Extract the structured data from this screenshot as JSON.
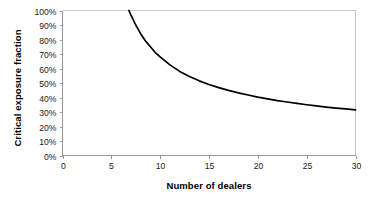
{
  "chart_data": {
    "type": "line",
    "title": "",
    "xlabel": "Number of dealers",
    "ylabel": "Critical exposure fraction",
    "xlim": [
      0,
      30
    ],
    "ylim": [
      0,
      1.0
    ],
    "grid": false,
    "legend": null,
    "xticks": [
      "0",
      "5",
      "10",
      "15",
      "20",
      "25",
      "30"
    ],
    "xtick_values": [
      0,
      5,
      10,
      15,
      20,
      25,
      30
    ],
    "yticks": [
      "0%",
      "10%",
      "20%",
      "30%",
      "40%",
      "50%",
      "60%",
      "70%",
      "80%",
      "90%",
      "100%"
    ],
    "ytick_values": [
      0,
      0.1,
      0.2,
      0.3,
      0.4,
      0.5,
      0.6,
      0.7,
      0.8,
      0.9,
      1.0
    ],
    "series": [
      {
        "name": "critical exposure fraction",
        "color": "#000000",
        "x": [
          6.8,
          7,
          7.5,
          8,
          8.5,
          9,
          9.5,
          10,
          11,
          12,
          13,
          14,
          15,
          16,
          17,
          18,
          19,
          20,
          21,
          22,
          23,
          24,
          25,
          26,
          27,
          28,
          29,
          30
        ],
        "y": [
          1.0,
          0.97,
          0.9,
          0.84,
          0.79,
          0.75,
          0.71,
          0.68,
          0.625,
          0.58,
          0.545,
          0.515,
          0.49,
          0.468,
          0.449,
          0.432,
          0.417,
          0.403,
          0.391,
          0.379,
          0.369,
          0.359,
          0.35,
          0.342,
          0.334,
          0.327,
          0.321,
          0.315
        ]
      }
    ]
  },
  "axis_colors": {
    "axis": "#9a9a9a",
    "frame": "#c9c9c9",
    "curve": "#000000",
    "text": "#1a1a1a",
    "background": "#ffffff"
  }
}
